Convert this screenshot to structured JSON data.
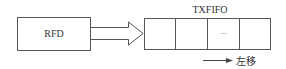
{
  "diagram": {
    "source_block": {
      "label": "RFD"
    },
    "target_block": {
      "label": "TXFIFO",
      "cells": 4,
      "ellipsis": "..."
    },
    "shift_note": {
      "label": "左移",
      "arrow_direction": "right"
    },
    "colors": {
      "stroke": "#555555",
      "text": "#333333",
      "background": "#ffffff"
    }
  }
}
